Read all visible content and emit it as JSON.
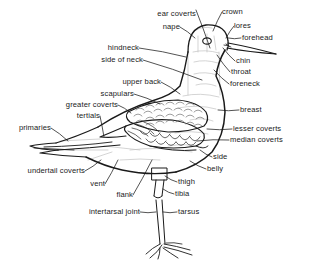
{
  "figure": {
    "colors": {
      "outline": "#1a1a1a",
      "interior_line": "#b8b8b8",
      "label_text": "#1a1a1a",
      "background": "#ffffff",
      "leader_line": "#1a1a1a"
    }
  },
  "labels": [
    {
      "id": "ear-coverts",
      "text": "ear coverts",
      "x": 148,
      "y": 10,
      "align": "right",
      "anchor_x": 196,
      "anchor_y": 10,
      "tip_x": 210,
      "tip_y": 48
    },
    {
      "id": "crown",
      "text": "crown",
      "x": 222,
      "y": 8,
      "align": "left",
      "anchor_x": 222,
      "anchor_y": 12,
      "tip_x": 213,
      "tip_y": 31
    },
    {
      "id": "nape",
      "text": "nape",
      "x": 155,
      "y": 23,
      "align": "right",
      "anchor_x": 180,
      "anchor_y": 27,
      "tip_x": 195,
      "tip_y": 38
    },
    {
      "id": "lores",
      "text": "lores",
      "x": 234,
      "y": 22,
      "align": "left",
      "anchor_x": 234,
      "anchor_y": 26,
      "tip_x": 226,
      "tip_y": 38
    },
    {
      "id": "forehead",
      "text": "forehead",
      "x": 242,
      "y": 34,
      "align": "left",
      "anchor_x": 241,
      "anchor_y": 38,
      "tip_x": 228,
      "tip_y": 38
    },
    {
      "id": "hindneck",
      "text": "hindneck",
      "x": 100,
      "y": 44,
      "align": "right",
      "anchor_x": 139,
      "anchor_y": 48,
      "tip_x": 186,
      "tip_y": 57
    },
    {
      "id": "side-of-neck",
      "text": "side of neck",
      "x": 100,
      "y": 56,
      "align": "right",
      "anchor_x": 143,
      "anchor_y": 60,
      "tip_x": 202,
      "tip_y": 80
    },
    {
      "id": "chin",
      "text": "chin",
      "x": 236,
      "y": 57,
      "align": "left",
      "anchor_x": 235,
      "anchor_y": 61,
      "tip_x": 223,
      "tip_y": 48
    },
    {
      "id": "throat",
      "text": "throat",
      "x": 231,
      "y": 68,
      "align": "left",
      "anchor_x": 230,
      "anchor_y": 72,
      "tip_x": 217,
      "tip_y": 55
    },
    {
      "id": "upper-back",
      "text": "upper back",
      "x": 100,
      "y": 78,
      "align": "right",
      "anchor_x": 161,
      "anchor_y": 82,
      "tip_x": 180,
      "tip_y": 94
    },
    {
      "id": "foreneck",
      "text": "foreneck",
      "x": 230,
      "y": 80,
      "align": "left",
      "anchor_x": 229,
      "anchor_y": 84,
      "tip_x": 214,
      "tip_y": 70
    },
    {
      "id": "scapulars",
      "text": "scapulars",
      "x": 60,
      "y": 90,
      "align": "right",
      "anchor_x": 134,
      "anchor_y": 94,
      "tip_x": 160,
      "tip_y": 104
    },
    {
      "id": "greater-coverts",
      "text": "greater coverts",
      "x": 50,
      "y": 101,
      "align": "right",
      "anchor_x": 118,
      "anchor_y": 105,
      "tip_x": 131,
      "tip_y": 113
    },
    {
      "id": "tertials",
      "text": "tertials",
      "x": 62,
      "y": 112,
      "align": "right",
      "anchor_x": 100,
      "anchor_y": 116,
      "tip_x": 104,
      "tip_y": 137
    },
    {
      "id": "primaries",
      "text": "primaries",
      "x": 12,
      "y": 124,
      "align": "right",
      "anchor_x": 51,
      "anchor_y": 128,
      "tip_x": 68,
      "tip_y": 141
    },
    {
      "id": "breast",
      "text": "breast",
      "x": 240,
      "y": 106,
      "align": "left",
      "anchor_x": 239,
      "anchor_y": 110,
      "tip_x": 218,
      "tip_y": 110
    },
    {
      "id": "lesser-coverts",
      "text": "lesser coverts",
      "x": 233,
      "y": 125,
      "align": "left",
      "anchor_x": 232,
      "anchor_y": 129,
      "tip_x": 207,
      "tip_y": 129
    },
    {
      "id": "median-coverts",
      "text": "median coverts",
      "x": 230,
      "y": 136,
      "align": "left",
      "anchor_x": 229,
      "anchor_y": 140,
      "tip_x": 197,
      "tip_y": 141
    },
    {
      "id": "side",
      "text": "side",
      "x": 213,
      "y": 153,
      "align": "left",
      "anchor_x": 212,
      "anchor_y": 157,
      "tip_x": 200,
      "tip_y": 150
    },
    {
      "id": "belly",
      "text": "belly",
      "x": 207,
      "y": 165,
      "align": "left",
      "anchor_x": 206,
      "anchor_y": 169,
      "tip_x": 190,
      "tip_y": 161
    },
    {
      "id": "undertail-coverts",
      "text": "undertail coverts",
      "x": 10,
      "y": 167,
      "align": "right",
      "anchor_x": 85,
      "anchor_y": 171,
      "tip_x": 101,
      "tip_y": 160
    },
    {
      "id": "vent",
      "text": "vent",
      "x": 87,
      "y": 180,
      "align": "right",
      "anchor_x": 105,
      "anchor_y": 184,
      "tip_x": 118,
      "tip_y": 160
    },
    {
      "id": "thigh",
      "text": "thigh",
      "x": 178,
      "y": 178,
      "align": "left",
      "anchor_x": 177,
      "anchor_y": 182,
      "tip_x": 165,
      "tip_y": 176
    },
    {
      "id": "flank",
      "text": "flank",
      "x": 113,
      "y": 191,
      "align": "right",
      "anchor_x": 133,
      "anchor_y": 195,
      "tip_x": 152,
      "tip_y": 160
    },
    {
      "id": "tibia",
      "text": "tibia",
      "x": 175,
      "y": 190,
      "align": "left",
      "anchor_x": 174,
      "anchor_y": 194,
      "tip_x": 163,
      "tip_y": 189
    },
    {
      "id": "intertarsal-joint",
      "text": "intertarsal joint",
      "x": 62,
      "y": 208,
      "align": "right",
      "anchor_x": 140,
      "anchor_y": 212,
      "tip_x": 156,
      "tip_y": 212
    },
    {
      "id": "tarsus",
      "text": "tarsus",
      "x": 178,
      "y": 208,
      "align": "left",
      "anchor_x": 177,
      "anchor_y": 212,
      "tip_x": 163,
      "tip_y": 212
    }
  ]
}
